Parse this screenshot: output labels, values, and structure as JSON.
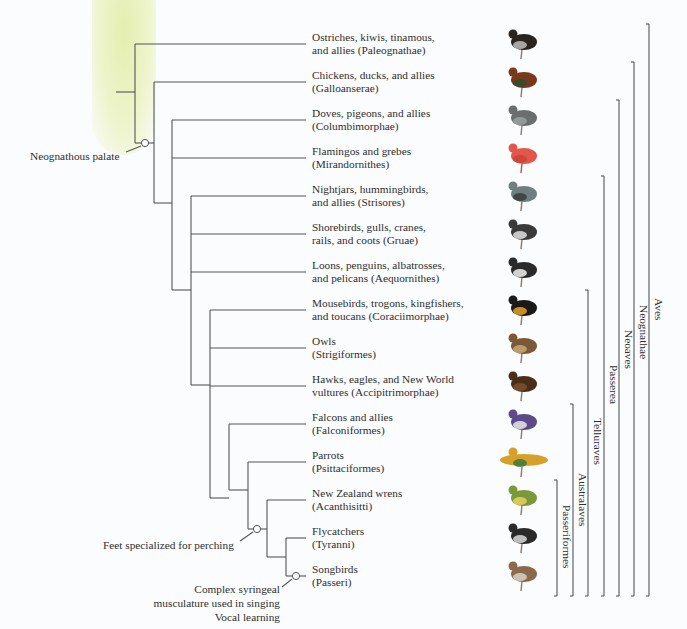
{
  "diagram": {
    "type": "phylogenetic-tree",
    "tips": [
      {
        "line1": "Ostriches, kiwis, tinamous,",
        "line2": "and allies (Paleognathae)",
        "bird": "ostrich"
      },
      {
        "line1": "Chickens, ducks, and allies",
        "line2": "(Galloanserae)",
        "bird": "rooster"
      },
      {
        "line1": "Doves, pigeons, and allies",
        "line2": "(Columbimorphae)",
        "bird": "pigeon"
      },
      {
        "line1": "Flamingos and grebes",
        "line2": "(Mirandornithes)",
        "bird": "flamingo"
      },
      {
        "line1": "Nightjars, hummingbirds,",
        "line2": "and allies (Strisores)",
        "bird": "hummingbird"
      },
      {
        "line1": "Shorebirds, gulls, cranes,",
        "line2": "rails, and coots (Gruae)",
        "bird": "gull"
      },
      {
        "line1": "Loons, penguins, albatrosses,",
        "line2": "and pelicans (Aequornithes)",
        "bird": "penguin"
      },
      {
        "line1": "Mousebirds, trogons, kingfishers,",
        "line2": "and toucans (Coraciimorphae)",
        "bird": "toucan"
      },
      {
        "line1": "Owls",
        "line2": "(Strigiformes)",
        "bird": "owl"
      },
      {
        "line1": "Hawks, eagles, and New World",
        "line2": "vultures (Accipitrimorphae)",
        "bird": "eagle"
      },
      {
        "line1": "Falcons and allies",
        "line2": "(Falconiformes)",
        "bird": "falcon"
      },
      {
        "line1": "Parrots",
        "line2": "(Psittaciformes)",
        "bird": "parrot"
      },
      {
        "line1": "New Zealand wrens",
        "line2": "(Acanthisitti)",
        "bird": "wren"
      },
      {
        "line1": "Flycatchers",
        "line2": "(Tyranni)",
        "bird": "flycatcher"
      },
      {
        "line1": "Songbirds",
        "line2": "(Passeri)",
        "bird": "sparrow"
      }
    ],
    "annotations": {
      "neognathous": "Neognathous palate",
      "perching": "Feet specialized for perching",
      "syrinx_1": "Complex syringeal",
      "syrinx_2": "musculature used in singing",
      "syrinx_3": "Vocal learning"
    },
    "clades": [
      {
        "name": "Aves",
        "from_tip": 1,
        "to_tip": 15
      },
      {
        "name": "Neognathae",
        "from_tip": 2,
        "to_tip": 15
      },
      {
        "name": "Neoaves",
        "from_tip": 3,
        "to_tip": 15
      },
      {
        "name": "Passerea",
        "from_tip": 5,
        "to_tip": 15
      },
      {
        "name": "Telluraves",
        "from_tip": 8,
        "to_tip": 15
      },
      {
        "name": "Australaves",
        "from_tip": 11,
        "to_tip": 15
      },
      {
        "name": "Passeriformes",
        "from_tip": 13,
        "to_tip": 15
      }
    ],
    "colors": {
      "line": "#555555",
      "highlight": "#e6efb8"
    }
  }
}
